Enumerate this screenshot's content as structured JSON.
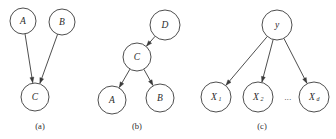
{
  "figure": {
    "background": "#ffffff",
    "stroke_color": "#3a3a3a",
    "text_color": "#2b2b2b",
    "width": 336,
    "height": 139
  },
  "panels": [
    {
      "id": "a",
      "caption": "(a)",
      "caption_x": 40,
      "caption_y": 127,
      "nodes": [
        {
          "id": "a-A",
          "label": "A",
          "sub": "",
          "cx": 23,
          "cy": 21,
          "r": 13
        },
        {
          "id": "a-B",
          "label": "B",
          "sub": "",
          "cx": 62,
          "cy": 22,
          "r": 13
        },
        {
          "id": "a-C",
          "label": "C",
          "sub": "",
          "cx": 35,
          "cy": 97,
          "r": 14
        }
      ],
      "edges": [
        {
          "id": "a-A-to-C",
          "from": "a-A",
          "to": "a-C",
          "directed": true
        },
        {
          "id": "a-B-to-C",
          "from": "a-B",
          "to": "a-C",
          "directed": true
        }
      ],
      "ellipsis": null
    },
    {
      "id": "b",
      "caption": "(b)",
      "caption_x": 137,
      "caption_y": 127,
      "nodes": [
        {
          "id": "b-D",
          "label": "D",
          "sub": "",
          "cx": 165,
          "cy": 25,
          "r": 15
        },
        {
          "id": "b-C",
          "label": "C",
          "sub": "",
          "cx": 137,
          "cy": 57,
          "r": 14
        },
        {
          "id": "b-A",
          "label": "A",
          "sub": "",
          "cx": 112,
          "cy": 100,
          "r": 14
        },
        {
          "id": "b-B",
          "label": "B",
          "sub": "",
          "cx": 160,
          "cy": 98,
          "r": 14
        }
      ],
      "edges": [
        {
          "id": "b-D-to-C",
          "from": "b-D",
          "to": "b-C",
          "directed": true
        },
        {
          "id": "b-C-to-A",
          "from": "b-C",
          "to": "b-A",
          "directed": true
        },
        {
          "id": "b-C-to-B",
          "from": "b-C",
          "to": "b-B",
          "directed": true
        }
      ],
      "ellipsis": null
    },
    {
      "id": "c",
      "caption": "(c)",
      "caption_x": 262,
      "caption_y": 127,
      "nodes": [
        {
          "id": "c-y",
          "label": "y",
          "sub": "",
          "cx": 277,
          "cy": 25,
          "r": 15
        },
        {
          "id": "c-X1",
          "label": "X",
          "sub": "1",
          "cx": 216,
          "cy": 97,
          "r": 15
        },
        {
          "id": "c-X2",
          "label": "X",
          "sub": "2",
          "cx": 258,
          "cy": 97,
          "r": 15
        },
        {
          "id": "c-Xd",
          "label": "X",
          "sub": "d",
          "cx": 314,
          "cy": 97,
          "r": 15
        }
      ],
      "edges": [
        {
          "id": "c-y-to-X1",
          "from": "c-y",
          "to": "c-X1",
          "directed": true
        },
        {
          "id": "c-y-to-X2",
          "from": "c-y",
          "to": "c-X2",
          "directed": true
        },
        {
          "id": "c-y-to-Xd",
          "from": "c-y",
          "to": "c-Xd",
          "directed": true
        }
      ],
      "ellipsis": {
        "text": "...",
        "x": 288,
        "y": 98
      }
    }
  ]
}
